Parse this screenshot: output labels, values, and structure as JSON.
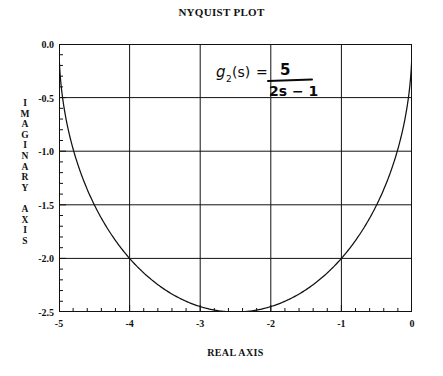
{
  "chart_data": {
    "type": "line",
    "title": "NYQUIST PLOT",
    "xlabel": "REAL AXIS",
    "ylabel": "IMAGINARY AXIS",
    "xlim": [
      -5,
      0
    ],
    "ylim": [
      -2.5,
      0.0
    ],
    "grid": true,
    "legend": null,
    "xticks": [
      "-5",
      "-4",
      "-3",
      "-2",
      "-1",
      "0"
    ],
    "xtick_values": [
      -5,
      -4,
      -3,
      -2,
      -1,
      0
    ],
    "yticks": [
      "0.0",
      "-0.5",
      "-1.0",
      "-1.5",
      "-2.0",
      "-2.5"
    ],
    "ytick_values": [
      0.0,
      -0.5,
      -1.0,
      -1.5,
      -2.0,
      -2.5
    ],
    "x_minor_ticks_per_interval": 5,
    "y_minor_ticks_per_interval": 5,
    "annotation": "g2(s) = 5 / (2s - 1)",
    "annotation_parts": {
      "function": "g",
      "subscript": "2",
      "argument": "(s)",
      "equals": "=",
      "numerator": "5",
      "denominator": "2s − 1"
    },
    "series": [
      {
        "name": "Nyquist locus of g2(s) = 5/(2s-1)",
        "description": "Semicircle centered at (-2.5, 0) with radius 2.5 in the lower half plane",
        "x": [
          -5.0,
          -4.99,
          -4.96,
          -4.91,
          -4.83,
          -4.74,
          -4.62,
          -4.49,
          -4.33,
          -4.16,
          -3.98,
          -3.78,
          -3.57,
          -3.35,
          -3.12,
          -2.89,
          -2.66,
          -2.43,
          -2.19,
          -1.96,
          -1.73,
          -1.51,
          -1.29,
          -1.08,
          -0.88,
          -0.7,
          -0.53,
          -0.38,
          -0.25,
          -0.15,
          -0.08,
          -0.03,
          -0.01,
          0.0
        ],
        "y": [
          0.0,
          -0.25,
          -0.49,
          -0.72,
          -0.95,
          -1.16,
          -1.35,
          -1.53,
          -1.7,
          -1.84,
          -1.97,
          -2.08,
          -2.18,
          -2.26,
          -2.33,
          -2.39,
          -2.43,
          -2.46,
          -2.48,
          -2.5,
          -2.5,
          -2.49,
          -2.47,
          -2.44,
          -2.39,
          -2.33,
          -2.25,
          -2.15,
          -2.03,
          -1.88,
          -1.69,
          -1.43,
          -1.05,
          0.0
        ]
      }
    ],
    "curve_geometry": {
      "shape": "semicircle",
      "center_x": -2.5,
      "center_y": 0.0,
      "radius": 2.5,
      "half": "lower"
    },
    "colors": {
      "curve": "#111111",
      "grid": "#111111",
      "frame": "#111111",
      "background": "#ffffff",
      "text": "#111111"
    }
  }
}
